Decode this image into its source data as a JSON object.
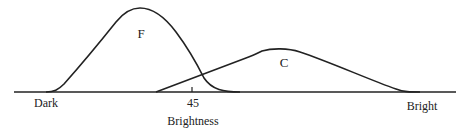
{
  "diagram": {
    "axis": {
      "label": "Brightness",
      "left_label": "Dark",
      "right_label": "Bright",
      "tick_label": "45",
      "color": "#222222"
    },
    "curves": [
      {
        "id": "F",
        "label": "F"
      },
      {
        "id": "C",
        "label": "C"
      }
    ]
  }
}
